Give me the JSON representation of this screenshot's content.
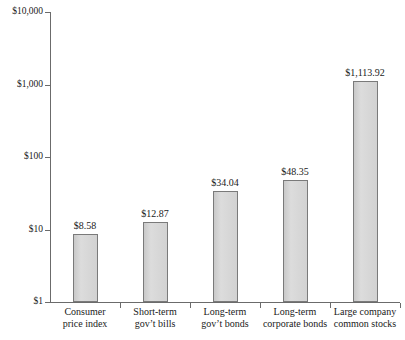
{
  "chart_data": {
    "type": "bar",
    "title": "",
    "xlabel": "",
    "ylabel": "",
    "yscale": "log",
    "ylim": [
      1,
      10000
    ],
    "grid": false,
    "legend": null,
    "ytick_labels": [
      "$10,000",
      "$1,000",
      "$100",
      "$10",
      "$1"
    ],
    "ytick_values": [
      10000,
      1000,
      100,
      10,
      1
    ],
    "categories": [
      "Consumer price index",
      "Short-term gov’t bills",
      "Long-term gov’t bonds",
      "Long-term corporate bonds",
      "Large company common stocks"
    ],
    "category_lines": [
      [
        "Consumer",
        "price index"
      ],
      [
        "Short-term",
        "gov’t bills"
      ],
      [
        "Long-term",
        "gov’t bonds"
      ],
      [
        "Long-term",
        "corporate bonds"
      ],
      [
        "Large company",
        "common stocks"
      ]
    ],
    "values": [
      8.58,
      12.87,
      34.04,
      48.35,
      1113.92
    ],
    "value_labels": [
      "$8.58",
      "$12.87",
      "$34.04",
      "$48.35",
      "$1,113.92"
    ],
    "colors": {
      "bar_fill": "#d4d4d4",
      "bar_border": "#7a7a7a",
      "axis": "#6b6b6b",
      "text": "#1a1a1a",
      "background": "#ffffff"
    }
  }
}
